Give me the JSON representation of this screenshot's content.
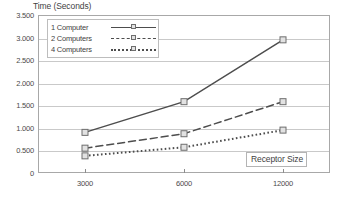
{
  "chart_data": {
    "type": "line",
    "title": "",
    "xlabel": "Receptor Size",
    "ylabel": "Time (Seconds)",
    "categories": [
      "3000",
      "6000",
      "12000"
    ],
    "series": [
      {
        "name": "1 Computer",
        "values": [
          0.9,
          1.58,
          2.95
        ],
        "style": "solid"
      },
      {
        "name": "2 Computers",
        "values": [
          0.55,
          0.87,
          1.58
        ],
        "style": "dashed"
      },
      {
        "name": "4 Computers",
        "values": [
          0.38,
          0.57,
          0.95
        ],
        "style": "dotted"
      }
    ],
    "ylim": [
      0,
      3.5
    ],
    "yticks": [
      "0",
      "0.500",
      "1.000",
      "1.500",
      "2.000",
      "2.500",
      "3.000",
      "3.500"
    ],
    "ytick_values": [
      0,
      0.5,
      1.0,
      1.5,
      2.0,
      2.5,
      3.0,
      3.5
    ],
    "grid": true,
    "legend_position": "top-left-inside",
    "marker": "open-square",
    "colors": {
      "line": "#4d4d4d",
      "marker_fill": "#e2e2e2",
      "marker_stroke": "#6e6e6e",
      "gridline": "#c9c9c9",
      "frame": "#a8a8a8",
      "text": "#3f3f3f",
      "background": "#ffffff"
    }
  }
}
